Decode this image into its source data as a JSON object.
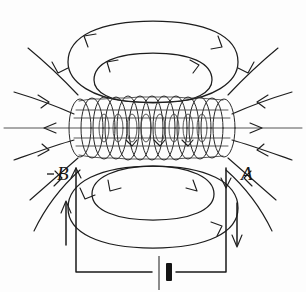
{
  "figure": {
    "terminal_labels": {
      "left": "B",
      "right": "A"
    },
    "colors": {
      "ink": "#1d1d1d",
      "background": "#fdfdfd",
      "axis": "#555555",
      "battery_negative": "#141414"
    },
    "elements": {
      "solenoid": "helical-coil",
      "battery": "battery-cell-symbol",
      "axis": "horizontal-axis-field-line",
      "left_wire_arrow": "up",
      "right_wire_arrow": "down",
      "top_loops": 2,
      "bottom_loops": 2,
      "field_lines_left": 4,
      "field_lines_right": 4
    }
  }
}
